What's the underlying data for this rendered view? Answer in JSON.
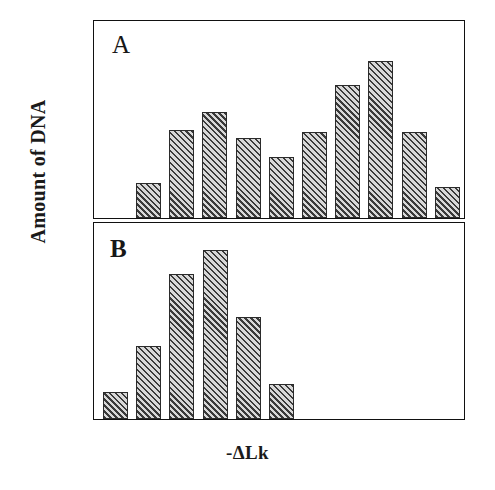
{
  "figure": {
    "ylabel": "Amount of DNA",
    "xlabel": "-ΔLk",
    "panel_a_letter": "A",
    "panel_b_letter": "B"
  },
  "chart_data": [
    {
      "type": "bar",
      "title": "A",
      "xlabel": "-ΔLk",
      "ylabel": "Amount of DNA",
      "categories": [
        "1",
        "2",
        "3",
        "4",
        "5",
        "6",
        "7",
        "8",
        "9",
        "10"
      ],
      "values": [
        18,
        45,
        54,
        41,
        31,
        44,
        68,
        80,
        44,
        16
      ],
      "ylim": [
        0,
        100
      ],
      "grid": false,
      "legend": "none",
      "bar_fill": "diagonal-hatch",
      "n_bars": 10
    },
    {
      "type": "bar",
      "title": "B",
      "xlabel": "-ΔLk",
      "ylabel": "Amount of DNA",
      "categories": [
        "1",
        "2",
        "3",
        "4",
        "5",
        "6",
        "7",
        "8",
        "9",
        "10"
      ],
      "values": [
        14,
        37,
        74,
        86,
        52,
        18,
        0,
        0,
        0,
        0
      ],
      "ylim": [
        0,
        100
      ],
      "grid": false,
      "legend": "none",
      "bar_fill": "diagonal-hatch",
      "n_bars": 6
    }
  ]
}
